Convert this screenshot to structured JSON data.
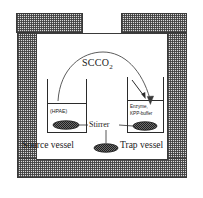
{
  "figure": {
    "colors": {
      "hatch_fill": "#d9d9d9",
      "hatch_line": "#3a3a3a",
      "chamber_fill": "#ffffff",
      "line": "#2b2b2b",
      "text": "#1a1a1a",
      "stirbar_fill": "#4a4a4a"
    }
  },
  "labels": {
    "scco2": "SCCO",
    "scco2_subscript": "2",
    "source_vessel": "Source vessel",
    "trap_vessel": "Trap vessel",
    "stirrer": "Stirrer",
    "source_contents": "(HPAE)",
    "trap_contents_line1": "Enzyme,",
    "trap_contents_line2": "KPP-buffer"
  },
  "components": {
    "autoclave_lid": "lid",
    "autoclave_wall_left": "left wall",
    "autoclave_wall_right": "right wall",
    "autoclave_wall_bottom": "bottom wall",
    "chamber": "pressure chamber",
    "transfer_arrow": "SCCO2 transfer arc from source vessel to trap vessel",
    "stir_bars": 3
  }
}
